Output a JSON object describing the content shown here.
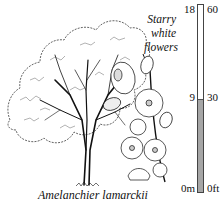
{
  "plant": {
    "botanical_name": "Amelanchier lamarckii",
    "flower_note_lines": [
      "Starry",
      "white",
      "flowers"
    ]
  },
  "height_scale": {
    "left_unit_labels": {
      "top": "18",
      "mid": "9",
      "bottom": "0m"
    },
    "right_unit_labels": {
      "top": "60",
      "mid": "30",
      "bottom": "0ft"
    },
    "fill_fraction": 0.5,
    "fill_color": "#a6a6a6"
  },
  "icons": {
    "tree": "tree-illustration",
    "flowers": "blossom-illustration"
  }
}
